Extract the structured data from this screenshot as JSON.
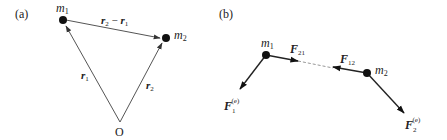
{
  "panels": [
    {
      "tag": "(a)",
      "masses": [
        {
          "name": "m",
          "sub": "1"
        },
        {
          "name": "m",
          "sub": "2"
        }
      ],
      "origin": "O",
      "vectors": [
        {
          "name": "r",
          "sub": "1",
          "from": "O",
          "to": "m1"
        },
        {
          "name": "r",
          "sub": "2",
          "from": "O",
          "to": "m2"
        },
        {
          "name": "r",
          "sub": "2",
          "minus": " − ",
          "name2": "r",
          "sub2": "1",
          "from": "m1",
          "to": "m2"
        }
      ]
    },
    {
      "tag": "(b)",
      "masses": [
        {
          "name": "m",
          "sub": "1"
        },
        {
          "name": "m",
          "sub": "2"
        }
      ],
      "forces": [
        {
          "name": "F",
          "sub": "21",
          "on": "m1",
          "kind": "internal"
        },
        {
          "name": "F",
          "sub": "12",
          "on": "m2",
          "kind": "internal"
        },
        {
          "name": "F",
          "sub": "1",
          "sup": "(e)",
          "on": "m1",
          "kind": "external"
        },
        {
          "name": "F",
          "sub": "2",
          "sup": "(e)",
          "on": "m2",
          "kind": "external"
        }
      ]
    }
  ],
  "colors": {
    "line": "#555555",
    "dot": "#111111",
    "text": "#222222",
    "dashed": "#999999"
  }
}
